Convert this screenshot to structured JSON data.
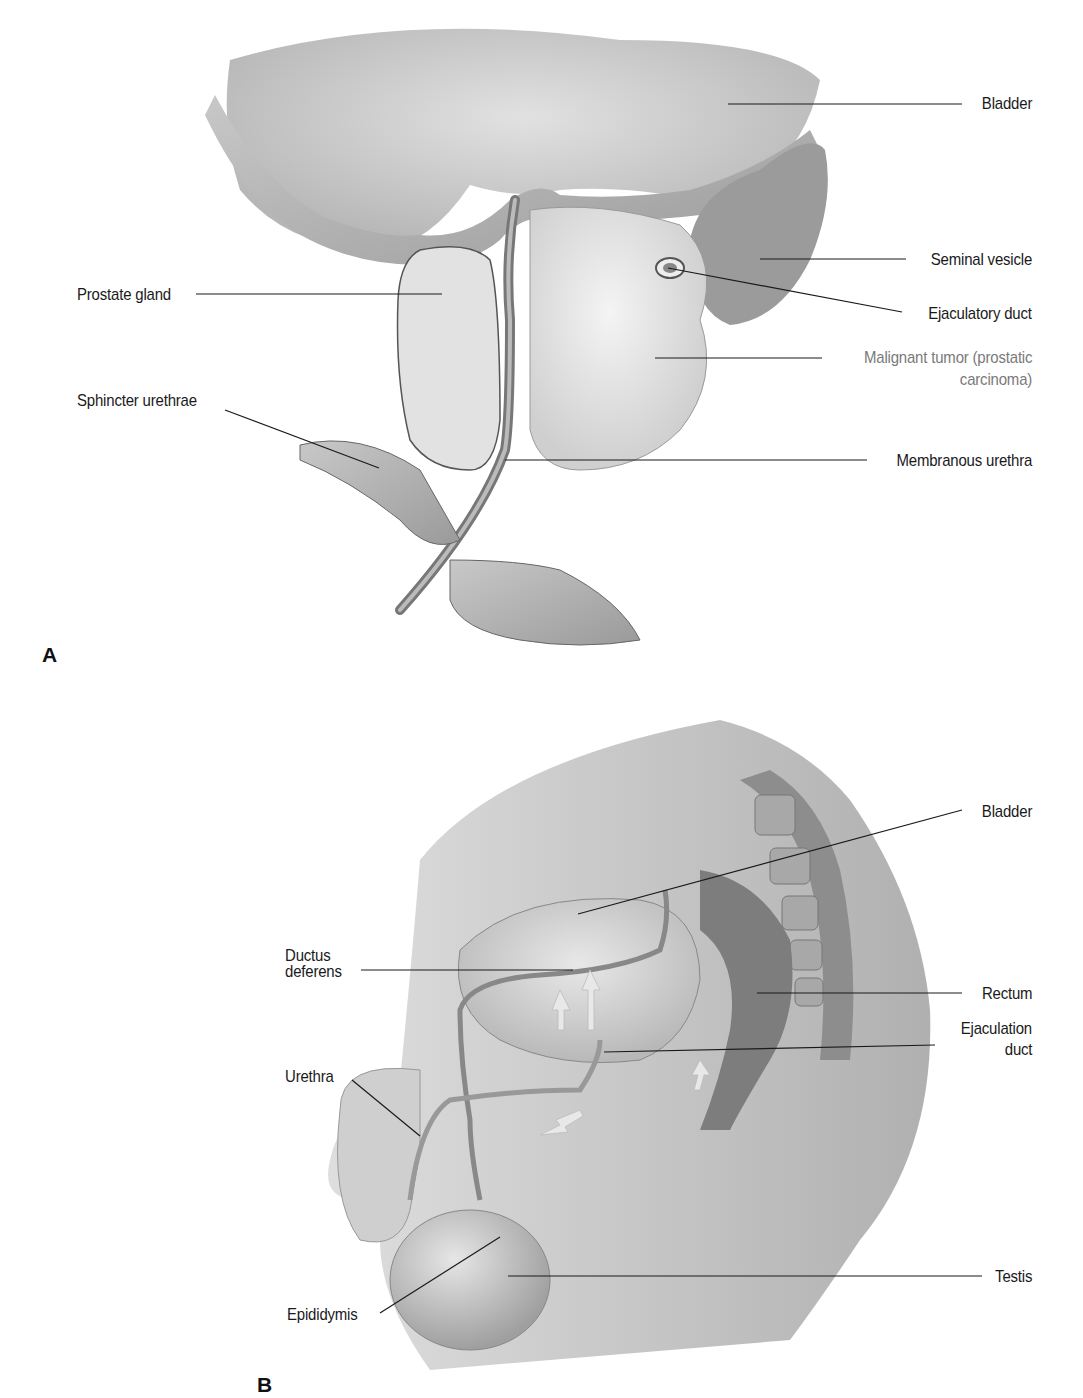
{
  "figure": {
    "panels": [
      {
        "id": "A",
        "letter": "A",
        "labels": [
          {
            "text": "Bladder",
            "side": "right"
          },
          {
            "text": "Seminal vesicle",
            "side": "right"
          },
          {
            "text": "Prostate gland",
            "side": "left"
          },
          {
            "text": "Ejaculatory duct",
            "side": "right"
          },
          {
            "text": "Malignant tumor (prostatic",
            "text2": "carcinoma)",
            "side": "right",
            "muted": true
          },
          {
            "text": "Sphincter urethrae",
            "side": "left"
          },
          {
            "text": "Membranous urethra",
            "side": "right"
          }
        ]
      },
      {
        "id": "B",
        "letter": "B",
        "labels": [
          {
            "text": "Bladder",
            "side": "right"
          },
          {
            "text": "Ductus",
            "text2": "deferens",
            "side": "left"
          },
          {
            "text": "Rectum",
            "side": "right"
          },
          {
            "text": "Ejaculation",
            "text2": "duct",
            "side": "right"
          },
          {
            "text": "Urethra",
            "side": "left"
          },
          {
            "text": "Testis",
            "side": "right"
          },
          {
            "text": "Epididymis",
            "side": "left"
          }
        ]
      }
    ]
  },
  "colors": {
    "line": "#1a1a1a",
    "muted_label": "#7a7a7a",
    "tissue_light": "#e6e6e6",
    "tissue_mid": "#bdbdbd",
    "tissue_dark": "#8c8c8c"
  }
}
